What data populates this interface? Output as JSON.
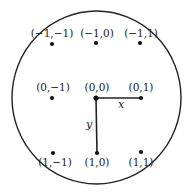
{
  "diagram": {
    "boundary": {
      "shape": "circle",
      "cx": 96.5,
      "cy": 97.5,
      "rx": 84.5,
      "ry": 86.5,
      "stroke": "#222222"
    },
    "axes": {
      "x": {
        "label": "x",
        "from": [
          96,
          98
        ],
        "to": [
          141,
          98
        ]
      },
      "y": {
        "label": "y",
        "from": [
          96,
          98
        ],
        "to": [
          97,
          153
        ]
      }
    },
    "points": [
      {
        "label": "(−1,−1)",
        "dot": [
          52,
          44
        ],
        "text": [
          52,
          37
        ]
      },
      {
        "label": "(−1,0)",
        "dot": [
          96,
          43
        ],
        "text": [
          97,
          37
        ]
      },
      {
        "label": "(−1,1)",
        "dot": [
          140,
          43
        ],
        "text": [
          141,
          37
        ]
      },
      {
        "label": "(0,−1)",
        "dot": [
          52,
          98
        ],
        "text": [
          53,
          91
        ]
      },
      {
        "label": "(0,0)",
        "dot": [
          96,
          98
        ],
        "text": [
          97,
          91
        ]
      },
      {
        "label": "(0,1)",
        "dot": [
          141,
          98
        ],
        "text": [
          141,
          91
        ]
      },
      {
        "label": "(1,−1)",
        "dot": [
          53,
          153
        ],
        "text": [
          55,
          166
        ]
      },
      {
        "label": "(1,0)",
        "dot": [
          97,
          153
        ],
        "text": [
          97,
          166
        ]
      },
      {
        "label": "(1,1)",
        "dot": [
          141,
          152
        ],
        "text": [
          141,
          166
        ]
      }
    ]
  }
}
